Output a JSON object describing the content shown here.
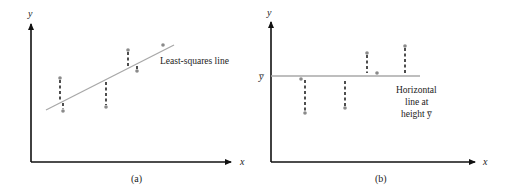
{
  "panels": [
    {
      "id": "a",
      "caption": "(a)",
      "x_axis_label": "x",
      "y_axis_label": "y",
      "fit_label": "Least-squares line",
      "line_type": "least-squares",
      "line": {
        "x1": 46,
        "y1": 110,
        "x2": 174,
        "y2": 45
      },
      "residuals": [
        {
          "px": 60,
          "py": 78,
          "ly": 103,
          "end_x": 63,
          "end_y": 111
        },
        {
          "px": 106,
          "py": 107,
          "ly": 80
        },
        {
          "px": 128,
          "py": 50,
          "ly": 69
        },
        {
          "px": 137,
          "py": 71,
          "ly": 65
        },
        {
          "px": 163,
          "py": 45,
          "ly": 51
        }
      ]
    },
    {
      "id": "b",
      "caption": "(b)",
      "x_axis_label": "x",
      "y_axis_label": "y",
      "mean_label": "y̅",
      "fit_label_lines": [
        "Horizontal",
        "line at",
        "height y̅"
      ],
      "line_type": "horizontal-mean",
      "line": {
        "x1": 271,
        "y1": 76,
        "x2": 420,
        "y2": 76
      },
      "residuals": [
        {
          "px": 305,
          "py": 113,
          "ly": 79
        },
        {
          "px": 345,
          "py": 108,
          "ly": 81
        },
        {
          "px": 367,
          "py": 53,
          "ly": 73
        },
        {
          "px": 377,
          "py": 73,
          "ly": 76
        },
        {
          "px": 405,
          "py": 46,
          "ly": 74
        }
      ]
    }
  ],
  "colors": {
    "axis": "#111111",
    "fit_line": "#a8a8a8",
    "residual": "#222222",
    "point": "#8a8a8a",
    "text": "#222222"
  }
}
